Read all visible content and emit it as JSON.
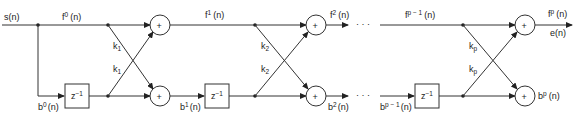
{
  "diagram": {
    "type": "lattice-filter",
    "input_label": "s(n)",
    "output_forward_label": "f",
    "output_forward_sup": "p",
    "output_forward_suffix": "(n)",
    "output_error_label": "e(n)",
    "output_backward_label": "b",
    "output_backward_sup": "p",
    "output_backward_suffix": "(n)",
    "delay_label": "z",
    "delay_sup": "−1",
    "adder_symbol": "+",
    "ellipsis": "· · ·",
    "signals": {
      "f0": {
        "base": "f",
        "sup": "0",
        "suffix": "(n)"
      },
      "b0": {
        "base": "b",
        "sup": "0",
        "suffix": "(n)"
      },
      "f1": {
        "base": "f",
        "sup": "1",
        "suffix": "(n)"
      },
      "b1": {
        "base": "b",
        "sup": "1",
        "suffix": "(n)"
      },
      "f2": {
        "base": "f",
        "sup": "2",
        "suffix": "(n)"
      },
      "b2": {
        "base": "b",
        "sup": "2",
        "suffix": "(n)"
      },
      "fpm1": {
        "base": "f",
        "sup": "p − 1",
        "suffix": "(n)"
      },
      "bpm1": {
        "base": "b",
        "sup": "p − 1",
        "suffix": "(n)"
      }
    },
    "stages": [
      {
        "coef_base": "k",
        "coef_sub": "1"
      },
      {
        "coef_base": "k",
        "coef_sub": "2"
      },
      {
        "coef_base": "k",
        "coef_sub": "p"
      }
    ]
  }
}
